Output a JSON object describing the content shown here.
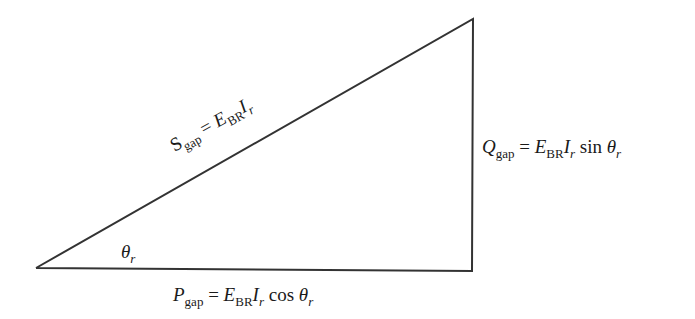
{
  "diagram": {
    "type": "power-triangle",
    "vertices": {
      "bottom_left": [
        36,
        268
      ],
      "bottom_right": [
        472,
        271
      ],
      "top_right": [
        473,
        19
      ]
    },
    "stroke_color": "#333333",
    "labels": {
      "hypotenuse": {
        "symbol": "S",
        "symbol_sub": "gap",
        "eq": "=",
        "E": "E",
        "E_sub": "BR",
        "I": "I",
        "I_sub": "r",
        "func": "",
        "theta": "",
        "theta_sub": ""
      },
      "vertical": {
        "symbol": "Q",
        "symbol_sub": "gap",
        "eq": "=",
        "E": "E",
        "E_sub": "BR",
        "I": "I",
        "I_sub": "r",
        "func": "sin",
        "theta": "θ",
        "theta_sub": "r"
      },
      "horizontal": {
        "symbol": "P",
        "symbol_sub": "gap",
        "eq": "=",
        "E": "E",
        "E_sub": "BR",
        "I": "I",
        "I_sub": "r",
        "func": "cos",
        "theta": "θ",
        "theta_sub": "r"
      },
      "angle": {
        "theta": "θ",
        "theta_sub": "r"
      }
    }
  }
}
